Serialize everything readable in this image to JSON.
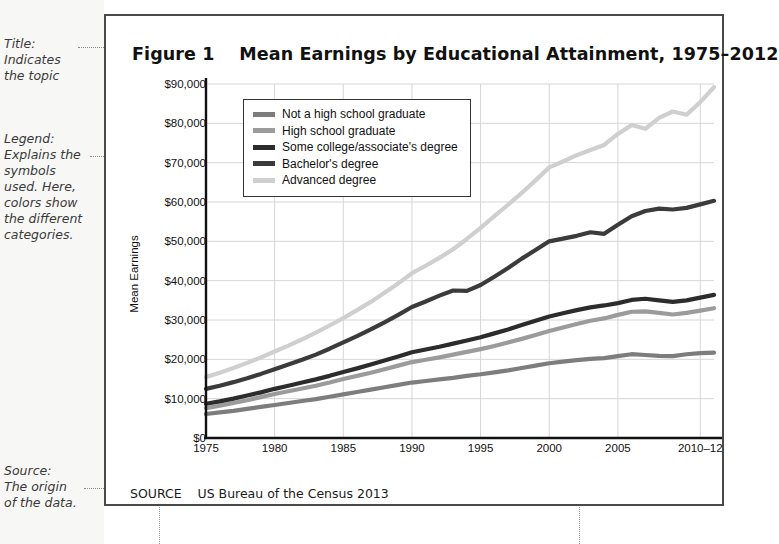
{
  "annotations": [
    {
      "id": "title",
      "text": "Title:\nIndicates\nthe topic"
    },
    {
      "id": "legend",
      "text": "Legend:\nExplains the\nsymbols\nused. Here,\ncolors show\nthe different\ncategories."
    },
    {
      "id": "source",
      "text": "Source:\nThe origin\nof the data."
    }
  ],
  "figure": {
    "label": "Figure 1",
    "title": "Mean Earnings by Educational Attainment, 1975–2012",
    "title_full": "Figure 1    Mean Earnings by Educational Attainment, 1975–2012",
    "source_label": "SOURCE",
    "source_text": "US Bureau of the Census 2013",
    "source_full": "SOURCE    US Bureau of the Census 2013"
  },
  "chart_data": {
    "type": "line",
    "title": "Mean Earnings by Educational Attainment, 1975–2012",
    "xlabel": "",
    "ylabel": "Mean Earnings",
    "ylim": [
      0,
      90000
    ],
    "ytick_labels": [
      "$90,000",
      "$80,000",
      "$70,000",
      "$60,000",
      "$50,000",
      "$40,000",
      "$30,000",
      "$20,000",
      "$10,000",
      "$0"
    ],
    "ytick_values": [
      90000,
      80000,
      70000,
      60000,
      50000,
      40000,
      30000,
      20000,
      10000,
      0
    ],
    "xlim": [
      1975,
      2012
    ],
    "xtick_labels": [
      "1975",
      "1980",
      "1985",
      "1990",
      "1995",
      "2000",
      "2005",
      "2010–12"
    ],
    "xtick_values": [
      1975,
      1980,
      1985,
      1990,
      1995,
      2000,
      2005,
      2011
    ],
    "grid": true,
    "legend_position": "upper-left-inside",
    "x": [
      1975,
      1976,
      1977,
      1978,
      1979,
      1980,
      1981,
      1982,
      1983,
      1984,
      1985,
      1986,
      1987,
      1988,
      1989,
      1990,
      1991,
      1992,
      1993,
      1994,
      1995,
      1996,
      1997,
      1998,
      1999,
      2000,
      2001,
      2002,
      2003,
      2004,
      2005,
      2006,
      2007,
      2008,
      2009,
      2010,
      2011,
      2012
    ],
    "series": [
      {
        "name": "Not a high school graduate",
        "color": "#7d7d7d",
        "values": [
          6100,
          6500,
          6900,
          7400,
          7900,
          8400,
          8900,
          9400,
          9900,
          10500,
          11100,
          11700,
          12300,
          12900,
          13500,
          14100,
          14500,
          14900,
          15300,
          15800,
          16200,
          16700,
          17200,
          17800,
          18400,
          19000,
          19400,
          19800,
          20100,
          20300,
          20800,
          21300,
          21100,
          20900,
          20800,
          21300,
          21600,
          21700
        ]
      },
      {
        "name": "High school graduate",
        "color": "#9b9b9b",
        "values": [
          7600,
          8200,
          8900,
          9600,
          10400,
          11200,
          11900,
          12600,
          13300,
          14100,
          15000,
          15800,
          16600,
          17500,
          18400,
          19300,
          19900,
          20500,
          21200,
          21900,
          22600,
          23400,
          24300,
          25200,
          26200,
          27200,
          28100,
          29000,
          29800,
          30400,
          31300,
          32100,
          32200,
          31800,
          31400,
          31800,
          32400,
          33000
        ]
      },
      {
        "name": "Some college/associate's degree",
        "color": "#2c2c2c",
        "values": [
          8700,
          9300,
          10000,
          10800,
          11600,
          12500,
          13300,
          14100,
          14900,
          15800,
          16800,
          17700,
          18700,
          19700,
          20700,
          21800,
          22500,
          23200,
          24000,
          24800,
          25600,
          26600,
          27600,
          28700,
          29800,
          30900,
          31700,
          32500,
          33200,
          33700,
          34300,
          35100,
          35400,
          35000,
          34600,
          35000,
          35700,
          36400
        ]
      },
      {
        "name": "Bachelor's degree",
        "color": "#3b3b3b",
        "values": [
          12500,
          13300,
          14200,
          15200,
          16300,
          17500,
          18700,
          19900,
          21200,
          22700,
          24300,
          25900,
          27600,
          29400,
          31300,
          33300,
          34700,
          36200,
          37500,
          37400,
          38900,
          41000,
          43200,
          45600,
          47800,
          50000,
          50700,
          51400,
          52300,
          51900,
          54200,
          56400,
          57700,
          58300,
          58100,
          58500,
          59400,
          60300
        ]
      },
      {
        "name": "Advanced degree",
        "color": "#cfcfcf",
        "values": [
          15500,
          16600,
          17800,
          19100,
          20500,
          22000,
          23500,
          25100,
          26800,
          28600,
          30500,
          32500,
          34600,
          36900,
          39300,
          41900,
          43800,
          45800,
          48000,
          50600,
          53400,
          56400,
          59300,
          62300,
          65500,
          68800,
          70300,
          71900,
          73200,
          74500,
          77300,
          79600,
          78600,
          81400,
          83000,
          82200,
          85400,
          89200
        ]
      }
    ]
  }
}
